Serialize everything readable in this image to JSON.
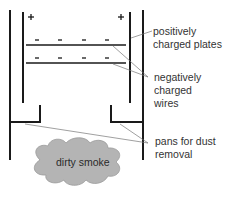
{
  "diagram": {
    "type": "electrostatic precipitator",
    "plate_symbols": {
      "left": "+",
      "right": "+"
    },
    "wire_symbol": "-",
    "colors": {
      "lines": "#1a1a1a",
      "leaders": "#777777",
      "smoke_fill": "#b4b4b4",
      "smoke_stroke": "#9a9a9a"
    }
  },
  "labels": {
    "plates": {
      "line1": "positively",
      "line2": "charged plates"
    },
    "wires": {
      "line1": "negatively",
      "line2": "charged",
      "line3": "wires"
    },
    "pans": {
      "line1": "pans for dust",
      "line2": "removal"
    },
    "smoke": "dirty smoke"
  }
}
